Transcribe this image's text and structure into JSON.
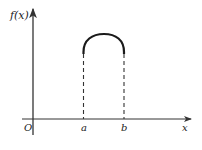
{
  "diagram": {
    "y_axis_label": "f(x)",
    "x_axis_label": "x",
    "origin_label": "O",
    "point_a_label": "a",
    "point_b_label": "b",
    "caption": "",
    "colors": {
      "axis": "#333333",
      "curve": "#1a1a1a",
      "dashed": "#333333",
      "text": "#222222"
    }
  }
}
